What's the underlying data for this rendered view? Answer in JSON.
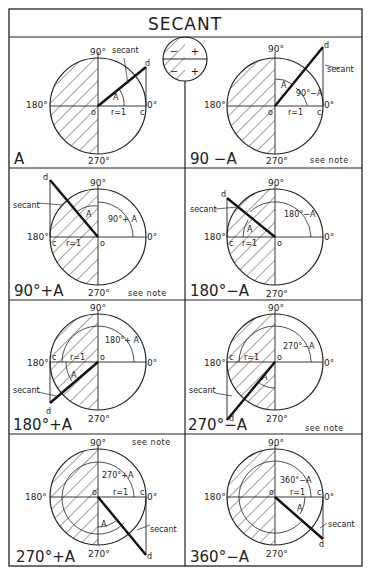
{
  "title": "SECANT",
  "legend": {
    "signs": {
      "upper_left": "−",
      "lower_left": "−",
      "upper_right": "+",
      "lower_right": "+"
    }
  },
  "common_labels": {
    "deg_90": "90°",
    "deg_180": "180°",
    "deg_270": "270°",
    "deg_0": "0°",
    "origin": "o",
    "point_c": "c",
    "point_d": "d",
    "radius": "r=1",
    "angle": "A",
    "secant": "secant",
    "see_note": "see note"
  },
  "panels": [
    {
      "id": "A",
      "label": "A",
      "arc_label": "",
      "see_note": false
    },
    {
      "id": "90-A",
      "label": "90 −A",
      "arc_label": "90°−A",
      "see_note": true
    },
    {
      "id": "90+A",
      "label": "90°+A",
      "arc_label": "90°+ A",
      "see_note": true
    },
    {
      "id": "180-A",
      "label": "180°−A",
      "arc_label": "180°−A",
      "see_note": false
    },
    {
      "id": "180+A",
      "label": "180°+A",
      "arc_label": "180°+ A",
      "see_note": false
    },
    {
      "id": "270-A",
      "label": "270°−A",
      "arc_label": "270°−A",
      "see_note": true
    },
    {
      "id": "270+A",
      "label": "270°+A",
      "arc_label": "270°+A",
      "see_note": true
    },
    {
      "id": "360-A",
      "label": "360°−A",
      "arc_label": "360°−A",
      "see_note": false
    }
  ],
  "colors": {
    "ink": "#222222",
    "paper": "#ffffff"
  }
}
